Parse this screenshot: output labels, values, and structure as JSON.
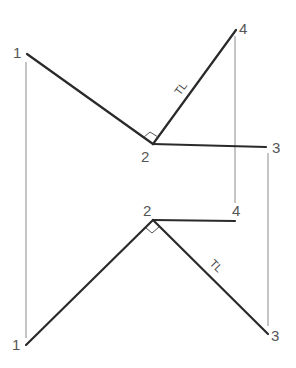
{
  "diagram": {
    "type": "descriptive-geometry-projection",
    "colors": {
      "object_line": "#2a2a2a",
      "projection_line": "#8a8a8a",
      "label": "#555555"
    },
    "top_view": {
      "points": [
        {
          "id": "1",
          "label": "1",
          "x": 27,
          "y": 54
        },
        {
          "id": "2",
          "label": "2",
          "x": 153,
          "y": 144
        },
        {
          "id": "3",
          "label": "3",
          "x": 266,
          "y": 147
        },
        {
          "id": "4",
          "label": "4",
          "x": 236,
          "y": 30
        }
      ],
      "lines": [
        {
          "from": "1",
          "to": "2"
        },
        {
          "from": "2",
          "to": "4",
          "annotation": "TL"
        },
        {
          "from": "2",
          "to": "3"
        }
      ],
      "right_angle_at": "2"
    },
    "bottom_view": {
      "points": [
        {
          "id": "1",
          "label": "1",
          "x": 26,
          "y": 345
        },
        {
          "id": "2",
          "label": "2",
          "x": 153,
          "y": 220
        },
        {
          "id": "3",
          "label": "3",
          "x": 268,
          "y": 334
        },
        {
          "id": "4",
          "label": "4",
          "x": 235,
          "y": 221
        }
      ],
      "lines": [
        {
          "from": "1",
          "to": "2"
        },
        {
          "from": "2",
          "to": "3",
          "annotation": "TL"
        },
        {
          "from": "2",
          "to": "4"
        }
      ],
      "right_angle_at": "2"
    },
    "annotations": {
      "true_length": "TL"
    }
  }
}
